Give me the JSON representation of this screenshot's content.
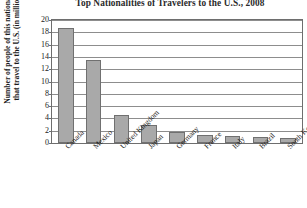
{
  "chart_data": {
    "type": "bar",
    "title": "Top Nationalities of Travelers to the U.S., 2008",
    "xlabel": "",
    "ylabel": "Number of people of this nationality that travel to the U.S. (in millions)",
    "ylim": [
      0,
      20
    ],
    "ytick_labels": [
      "20",
      "18",
      "16",
      "14",
      "12",
      "10",
      "8",
      "6",
      "4",
      "2",
      "0"
    ],
    "yticks": [
      20,
      18,
      16,
      14,
      12,
      10,
      8,
      6,
      4,
      2,
      0
    ],
    "grid": true,
    "legend": "none",
    "categories": [
      "Canada",
      "Mexico",
      "United Kingdom",
      "Japan",
      "Germany",
      "France",
      "Italy",
      "Brazil",
      "South Korea"
    ],
    "values": [
      18.7,
      13.5,
      4.6,
      3.0,
      1.8,
      1.3,
      1.2,
      0.9,
      0.8
    ],
    "bar_color": "#a9a9a9",
    "bar_border_color": "#707070",
    "gridline_color": "#8d8d8d",
    "axis_color": "#6e6e6e"
  }
}
